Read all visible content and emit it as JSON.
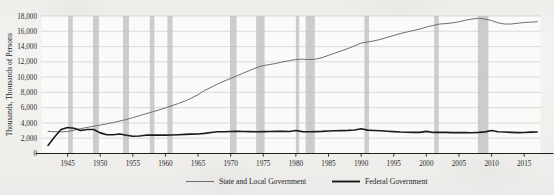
{
  "chart_data": {
    "type": "line",
    "title": "",
    "subtitle": "",
    "xlabel": "",
    "ylabel": "Thousands, Thousands of Persons",
    "xlim": [
      1941,
      2017.5
    ],
    "ylim": [
      0,
      18000
    ],
    "y_ticks": [
      0,
      2000,
      4000,
      6000,
      8000,
      10000,
      12000,
      14000,
      16000,
      18000
    ],
    "y_tick_labels": [
      "0",
      "2,000",
      "4,000",
      "6,000",
      "8,000",
      "10,000",
      "12,000",
      "14,000",
      "16,000",
      "18,000"
    ],
    "x_ticks": [
      1945,
      1950,
      1955,
      1960,
      1965,
      1970,
      1975,
      1980,
      1985,
      1990,
      1995,
      2000,
      2005,
      2010,
      2015
    ],
    "x_tick_labels": [
      "1945",
      "1950",
      "1955",
      "1960",
      "1965",
      "1970",
      "1975",
      "1980",
      "1985",
      "1990",
      "1995",
      "2000",
      "2005",
      "2010",
      "2015"
    ],
    "grid": true,
    "grid_axis": "y",
    "legend_position": "bottom",
    "colors": {
      "state_local": "#6e6e6e",
      "federal": "#1a1a1a",
      "recession_band": "#c9c9c9",
      "gridline": "#c5c5c5",
      "axis": "#1f1f1f",
      "background": "#f2f1ef"
    },
    "recession_bands": [
      {
        "start": 1945.1,
        "end": 1945.8
      },
      {
        "start": 1948.9,
        "end": 1949.8
      },
      {
        "start": 1953.5,
        "end": 1954.4
      },
      {
        "start": 1957.6,
        "end": 1958.3
      },
      {
        "start": 1960.3,
        "end": 1961.1
      },
      {
        "start": 1969.9,
        "end": 1970.9
      },
      {
        "start": 1973.9,
        "end": 1975.2
      },
      {
        "start": 1980.0,
        "end": 1980.5
      },
      {
        "start": 1981.5,
        "end": 1982.9
      },
      {
        "start": 1990.5,
        "end": 1991.2
      },
      {
        "start": 2001.2,
        "end": 2001.9
      },
      {
        "start": 2007.9,
        "end": 2009.5
      }
    ],
    "series": [
      {
        "name": "State and Local Government",
        "color": "#6e6e6e",
        "width": 1.0,
        "x": [
          1942,
          1943,
          1944,
          1945,
          1946,
          1947,
          1948,
          1949,
          1950,
          1951,
          1952,
          1953,
          1954,
          1955,
          1956,
          1957,
          1958,
          1959,
          1960,
          1961,
          1962,
          1963,
          1964,
          1965,
          1966,
          1967,
          1968,
          1969,
          1970,
          1971,
          1972,
          1973,
          1974,
          1975,
          1976,
          1977,
          1978,
          1979,
          1980,
          1981,
          1982,
          1983,
          1984,
          1985,
          1986,
          1987,
          1988,
          1989,
          1990,
          1991,
          1992,
          1993,
          1994,
          1995,
          1996,
          1997,
          1998,
          1999,
          2000,
          2001,
          2002,
          2003,
          2004,
          2005,
          2006,
          2007,
          2008,
          2009,
          2010,
          2011,
          2012,
          2013,
          2014,
          2015,
          2016,
          2017
        ],
        "y": [
          2900,
          2850,
          2830,
          2880,
          3050,
          3250,
          3420,
          3570,
          3720,
          3880,
          4050,
          4250,
          4450,
          4700,
          4950,
          5200,
          5450,
          5700,
          5970,
          6250,
          6550,
          6870,
          7250,
          7700,
          8250,
          8650,
          9100,
          9480,
          9830,
          10190,
          10550,
          10900,
          11250,
          11500,
          11650,
          11800,
          12000,
          12150,
          12300,
          12350,
          12300,
          12350,
          12550,
          12850,
          13150,
          13450,
          13750,
          14100,
          14450,
          14600,
          14750,
          14950,
          15200,
          15450,
          15700,
          15900,
          16100,
          16300,
          16550,
          16750,
          16950,
          17000,
          17100,
          17250,
          17450,
          17600,
          17700,
          17600,
          17400,
          17100,
          16950,
          16950,
          17050,
          17150,
          17200,
          17250
        ],
        "note": "Rises steadily from ~2,900 in 1942, overtakes Federal around 1946, plateaus briefly 1980-82, peaks near 2008-09, dips, then flattens"
      },
      {
        "name": "Federal Government",
        "color": "#1a1a1a",
        "width": 1.6,
        "x": [
          1942,
          1943,
          1944,
          1945,
          1946,
          1947,
          1948,
          1949,
          1950,
          1951,
          1952,
          1953,
          1954,
          1955,
          1956,
          1957,
          1958,
          1959,
          1960,
          1961,
          1962,
          1963,
          1964,
          1965,
          1966,
          1967,
          1968,
          1969,
          1970,
          1971,
          1972,
          1973,
          1974,
          1975,
          1976,
          1977,
          1978,
          1979,
          1980,
          1981,
          1982,
          1983,
          1984,
          1985,
          1986,
          1987,
          1988,
          1989,
          1990,
          1991,
          1992,
          1993,
          1994,
          1995,
          1996,
          1997,
          1998,
          1999,
          2000,
          2001,
          2002,
          2003,
          2004,
          2005,
          2006,
          2007,
          2008,
          2009,
          2010,
          2011,
          2012,
          2013,
          2014,
          2015,
          2016,
          2017
        ],
        "y": [
          1050,
          2150,
          3150,
          3400,
          3300,
          3000,
          3150,
          3150,
          2700,
          2450,
          2450,
          2550,
          2400,
          2250,
          2300,
          2400,
          2420,
          2400,
          2400,
          2420,
          2460,
          2500,
          2530,
          2560,
          2630,
          2750,
          2840,
          2850,
          2880,
          2900,
          2880,
          2860,
          2850,
          2870,
          2880,
          2900,
          2920,
          2880,
          3000,
          2860,
          2840,
          2870,
          2900,
          2950,
          2980,
          3000,
          3030,
          3080,
          3230,
          3060,
          3020,
          2970,
          2920,
          2870,
          2820,
          2790,
          2770,
          2770,
          2900,
          2760,
          2770,
          2760,
          2730,
          2730,
          2730,
          2720,
          2760,
          2830,
          3000,
          2850,
          2820,
          2770,
          2730,
          2750,
          2800,
          2810
        ],
        "note": "Spikes during WWII to ~3,400 in 1945, falls back by 1950; near-flat ~2,700-3,000 thereafter with decennial census spikes in 1980, 1990, 2000, 2010"
      }
    ],
    "legend": [
      {
        "label": "State and Local Government",
        "color": "#6e6e6e",
        "width": 1.0
      },
      {
        "label": "Federal Government",
        "color": "#1a1a1a",
        "width": 1.6
      }
    ]
  }
}
